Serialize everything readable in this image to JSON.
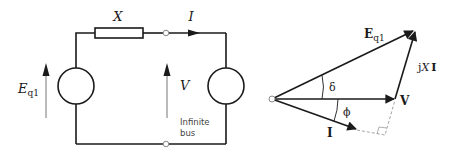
{
  "circuit": {
    "reactance_label": "X",
    "current_label": "I",
    "source_label_main": "E",
    "source_label_sub": "q1",
    "bus_voltage_label": "V",
    "bus_caption_line1": "Infinite",
    "bus_caption_line2": "bus"
  },
  "phasor": {
    "eq_label_main": "E",
    "eq_label_sub": "q1",
    "jxi_label_j": "j",
    "jxi_label_x": "X",
    "jxi_label_i": "I",
    "v_label": "V",
    "i_label": "I",
    "delta_label": "δ",
    "phi_label": "ϕ"
  },
  "colors": {
    "line": "#1a1a1a",
    "thin_arrow": "#777777",
    "dashed": "#999999",
    "caption": "#444444"
  }
}
